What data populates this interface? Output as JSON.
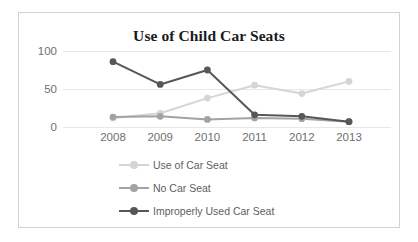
{
  "chart_data": {
    "type": "line",
    "title": "Use of Child Car Seats",
    "xlabel": "",
    "ylabel": "",
    "categories": [
      "2008",
      "2009",
      "2010",
      "2011",
      "2012",
      "2013"
    ],
    "ylim": [
      0,
      100
    ],
    "yticks": [
      "0",
      "50",
      "100"
    ],
    "grid": true,
    "legend_position": "bottom",
    "series": [
      {
        "name": "Use of Car Seat",
        "color": "#d5d5d5",
        "values": [
          12,
          18,
          38,
          55,
          44,
          60
        ]
      },
      {
        "name": "No Car Seat",
        "color": "#a3a3a3",
        "values": [
          13,
          14,
          10,
          12,
          11,
          7
        ]
      },
      {
        "name": "Improperly Used Car Seat",
        "color": "#575757",
        "values": [
          86,
          56,
          75,
          16,
          14,
          7
        ]
      }
    ]
  },
  "colors": {
    "frame_border": "#d2d2d2",
    "gridline": "#e8e8e8",
    "axis_text": "#6f6f6f",
    "title_text": "#1a1a1a",
    "legend_text": "#5e5e5e",
    "background": "#ffffff"
  }
}
